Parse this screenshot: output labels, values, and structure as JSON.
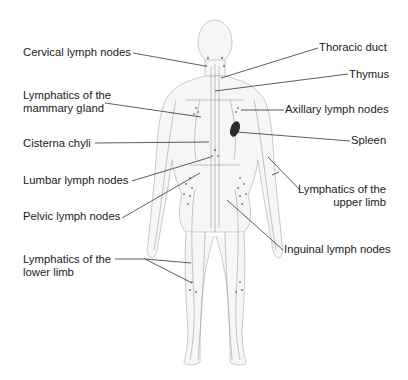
{
  "diagram": {
    "colors": {
      "text": "#1a1a1a",
      "leader_line": "#333333",
      "body_outline": "#b8b8b8",
      "body_fill": "#f4f4f4",
      "lymph_vessels": "#9a9a9a",
      "spleen": "#2a2a2a"
    },
    "labels": {
      "cervical": "Cervical lymph nodes",
      "mammary_line1": "Lymphatics of the",
      "mammary_line2": "mammary gland",
      "cisterna": "Cisterna chyli",
      "lumbar": "Lumbar lymph nodes",
      "pelvic": "Pelvic lymph nodes",
      "lower_limb_line1": "Lymphatics of the",
      "lower_limb_line2": "lower limb",
      "thoracic": "Thoracic duct",
      "thymus": "Thymus",
      "axillary": "Axillary lymph nodes",
      "spleen": "Spleen",
      "upper_limb_line1": "Lymphatics of the",
      "upper_limb_line2": "upper limb",
      "inguinal": "Inguinal lymph nodes"
    }
  }
}
